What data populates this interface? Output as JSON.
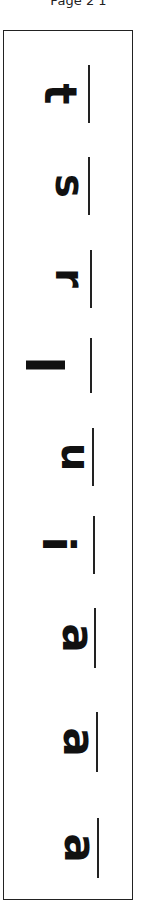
{
  "header": {
    "page_label": "Page 2 1"
  },
  "worksheet": {
    "orientation": "rotated-90",
    "letters": [
      {
        "char": "t",
        "top": 65,
        "baseline_x": 88,
        "baseline_top": 65,
        "baseline_h": 58,
        "glyph_left": 49,
        "glyph_top": 72,
        "size": 44
      },
      {
        "char": "s",
        "top": 150,
        "baseline_x": 88,
        "baseline_top": 157,
        "baseline_h": 58,
        "glyph_left": 58,
        "glyph_top": 166,
        "size": 40
      },
      {
        "char": "r",
        "top": 250,
        "baseline_x": 90,
        "baseline_top": 250,
        "baseline_h": 58,
        "glyph_left": 60,
        "glyph_top": 258,
        "size": 40
      },
      {
        "char": "l",
        "top": 335,
        "baseline_x": 90,
        "baseline_top": 338,
        "baseline_h": 55,
        "glyph_left": 35,
        "glyph_top": 339,
        "size": 52
      },
      {
        "char": "u",
        "top": 430,
        "baseline_x": 92,
        "baseline_top": 428,
        "baseline_h": 58,
        "glyph_left": 62,
        "glyph_top": 437,
        "size": 40
      },
      {
        "char": "i",
        "top": 515,
        "baseline_x": 93,
        "baseline_top": 516,
        "baseline_h": 58,
        "glyph_left": 50,
        "glyph_top": 522,
        "size": 44
      },
      {
        "char": "a",
        "top": 610,
        "baseline_x": 94,
        "baseline_top": 608,
        "baseline_h": 60,
        "glyph_left": 63,
        "glyph_top": 616,
        "size": 44
      },
      {
        "char": "a",
        "top": 712,
        "baseline_x": 96,
        "baseline_top": 712,
        "baseline_h": 60,
        "glyph_left": 64,
        "glyph_top": 720,
        "size": 44
      },
      {
        "char": "a",
        "top": 818,
        "baseline_x": 97,
        "baseline_top": 818,
        "baseline_h": 60,
        "glyph_left": 65,
        "glyph_top": 826,
        "size": 44
      }
    ]
  }
}
